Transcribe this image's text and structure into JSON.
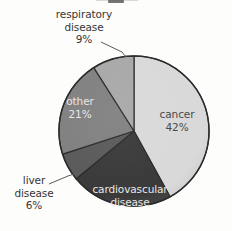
{
  "figure": {
    "title_fragment": "",
    "background_color": "#fdfdfc"
  },
  "chart_data": {
    "type": "pie",
    "title": "",
    "xlabel": "",
    "ylabel": "",
    "legend_position": "none",
    "grid": false,
    "label_style": "inside-and-callout",
    "start_angle_deg": 0,
    "direction": "clockwise",
    "categories": [
      "cancer",
      "cardiovascular disease",
      "liver disease",
      "other",
      "respiratory disease"
    ],
    "values": [
      42,
      22,
      6,
      21,
      9
    ],
    "slices": [
      {
        "name": "cancer",
        "label_line1": "cancer",
        "label_line2": "42%",
        "value": 42,
        "percent_text": "42%",
        "color": "#d9d9d9",
        "label_placement": "inside",
        "text_tone": "on-light"
      },
      {
        "name": "cardiovascular disease",
        "label_line1": "cardiovascular",
        "label_line2": "disease",
        "value": 22,
        "percent_text": "",
        "color": "#3a3a3a",
        "label_placement": "inside",
        "text_tone": "on-dark"
      },
      {
        "name": "liver disease",
        "label_line1": "liver",
        "label_line2": "disease",
        "label_line3": "6%",
        "value": 6,
        "percent_text": "6%",
        "color": "#5a5a5a",
        "label_placement": "callout",
        "text_tone": "outside"
      },
      {
        "name": "other",
        "label_line1": "other",
        "label_line2": "21%",
        "value": 21,
        "percent_text": "21%",
        "color": "#808080",
        "label_placement": "inside",
        "text_tone": "on-dark"
      },
      {
        "name": "respiratory disease",
        "label_line1": "respiratory",
        "label_line2": "disease",
        "label_line3": "9%",
        "value": 9,
        "percent_text": "9%",
        "color": "#a8a8a8",
        "label_placement": "callout",
        "text_tone": "outside"
      }
    ],
    "colors": [
      "#d9d9d9",
      "#3a3a3a",
      "#5a5a5a",
      "#808080",
      "#a8a8a8"
    ],
    "outline_color": "#2b2b2b",
    "center": {
      "x": 134,
      "y": 131
    },
    "radius": 75
  }
}
